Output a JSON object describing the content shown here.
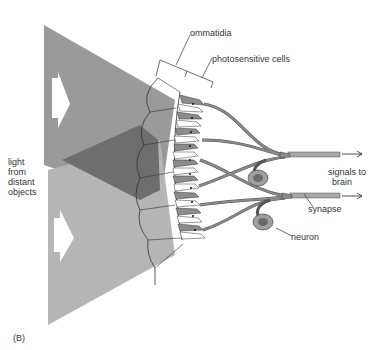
{
  "figure": {
    "panel_label": "(B)",
    "labels": {
      "ommatidia": "ommatidia",
      "photosensitive_cells": "photosensitive cells",
      "light_from_distant_objects": [
        "light",
        "from",
        "distant",
        "objects"
      ],
      "signals_to_brain": [
        "signals to",
        "brain"
      ],
      "synapse": "synapse",
      "neuron": "neuron"
    },
    "colors": {
      "light_upper": "#9a9a9a",
      "light_lower": "#b5b5b5",
      "overlap": "#6e6e6e",
      "cell_fill": "#8c8c8c",
      "nerve": "#8a8a8a",
      "neuron_body": "#a0a0a0",
      "neuron_nucleus": "#6a6a6a",
      "line": "#333333"
    }
  }
}
